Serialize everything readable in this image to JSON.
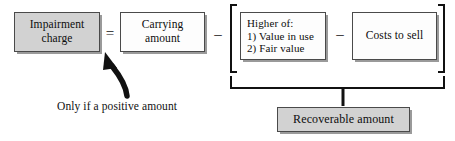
{
  "diagram": {
    "title_text": "Impairment charge formula",
    "boxes": {
      "impairment_charge": "Impairment\ncharge",
      "carrying_amount": "Carrying\namount",
      "higher_of_line1": "Higher of:",
      "higher_of_line2": "1) Value in use",
      "higher_of_line3": "2) Fair value",
      "costs_to_sell": "Costs to sell",
      "recoverable_amount": "Recoverable amount"
    },
    "operators": {
      "equals": "=",
      "minus_1": "–",
      "minus_2": "–"
    },
    "caption": "Only if a positive amount",
    "colors": {
      "box_fill_gray": "#d2d2d2",
      "box_fill_white": "#fdfdfd",
      "box_border": "#4a4a4a",
      "shadow": "#9a9a9a",
      "bracket": "#111111",
      "arrow": "#111111",
      "background": "#ffffff",
      "text": "#0d0d0d"
    }
  }
}
